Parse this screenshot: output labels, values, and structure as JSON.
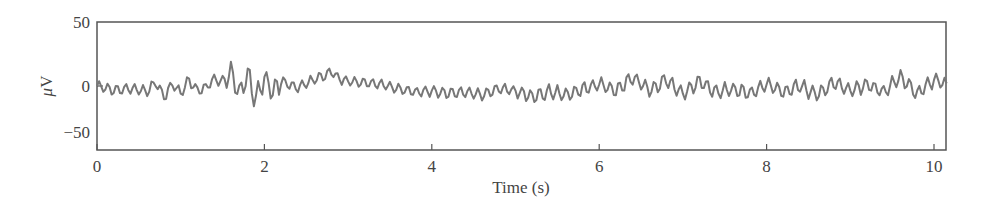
{
  "chart_data": {
    "type": "line",
    "title": "",
    "xlabel": "Time (s)",
    "ylabel": "μV",
    "xlim": [
      0,
      10.15
    ],
    "ylim": [
      -50,
      50
    ],
    "x_ticks": [
      0,
      2,
      4,
      6,
      8,
      10
    ],
    "x_tick_labels": [
      "0",
      "2",
      "4",
      "6",
      "8",
      "10"
    ],
    "y_ticks": [
      50,
      0,
      -50
    ],
    "y_tick_labels": [
      "50",
      "0",
      "−50"
    ],
    "grid": false,
    "legend": null,
    "line_color": "#777777",
    "series": [
      {
        "name": "EEG trace",
        "description": "Noisy EEG-like signal oscillating around 0 μV, amplitude mostly within ±15 μV; larger bursts (~±20 μV) near 1.5–2.1 s; slow hump peaking ~18 μV near 2.8 s; dip to about −12 μV around 4.3–4.7 s; steady oscillation ±10–15 μV from 5 s to 10 s.",
        "x": [
          0.0,
          0.2,
          0.4,
          0.6,
          0.7,
          0.8,
          0.9,
          1.0,
          1.1,
          1.2,
          1.3,
          1.4,
          1.5,
          1.6,
          1.7,
          1.8,
          1.9,
          2.0,
          2.1,
          2.2,
          2.4,
          2.6,
          2.8,
          2.9,
          3.0,
          3.2,
          3.4,
          3.6,
          3.8,
          4.0,
          4.2,
          4.4,
          4.6,
          4.8,
          5.0,
          5.2,
          5.4,
          5.6,
          5.8,
          6.0,
          6.2,
          6.4,
          6.6,
          6.8,
          7.0,
          7.2,
          7.4,
          7.6,
          7.8,
          8.0,
          8.2,
          8.4,
          8.6,
          8.8,
          9.0,
          9.2,
          9.4,
          9.6,
          9.8,
          10.0,
          10.15
        ],
        "y": [
          0,
          -5,
          -3,
          -8,
          5,
          -14,
          3,
          -10,
          8,
          -6,
          -2,
          10,
          5,
          18,
          -10,
          15,
          -18,
          12,
          -8,
          6,
          -2,
          8,
          18,
          10,
          6,
          4,
          2,
          -4,
          -8,
          -6,
          -10,
          -8,
          -12,
          -4,
          -6,
          -14,
          -8,
          -12,
          -4,
          2,
          -6,
          12,
          -6,
          8,
          -10,
          6,
          -8,
          -4,
          -10,
          2,
          -8,
          0,
          -12,
          4,
          -6,
          2,
          -8,
          12,
          -10,
          8,
          2
        ]
      }
    ]
  },
  "axes": {
    "xlabel": "Time (s)",
    "ylabel_prefix": "μ",
    "ylabel_unit": "V"
  }
}
